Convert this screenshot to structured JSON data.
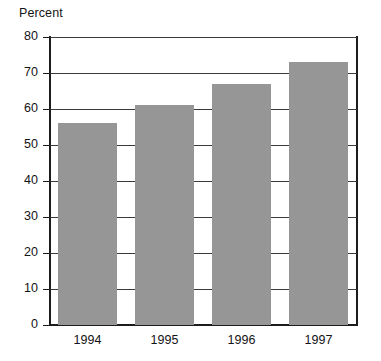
{
  "chart_data": {
    "type": "bar",
    "title": "",
    "xlabel": "",
    "ylabel": "Percent",
    "categories": [
      "1994",
      "1995",
      "1996",
      "1997"
    ],
    "values": [
      56,
      61,
      67,
      73
    ],
    "ylim": [
      0,
      80
    ],
    "ytick_labels": [
      "0",
      "10",
      "20",
      "30",
      "40",
      "50",
      "60",
      "70",
      "80"
    ],
    "ytick_values": [
      0,
      10,
      20,
      30,
      40,
      50,
      60,
      70,
      80
    ],
    "grid": true,
    "legend": "none",
    "bar_color": "#969696",
    "axis_color": "#1c1c1c",
    "grid_color": "#3a3a3a",
    "background": "#ffffff"
  },
  "labels": {
    "percent_caption": "Percent"
  }
}
